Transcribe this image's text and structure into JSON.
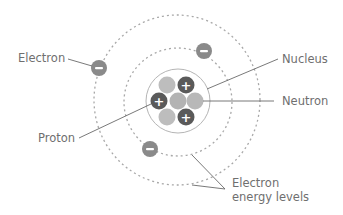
{
  "diagram": {
    "labels": {
      "electron": "Electron",
      "nucleus": "Nucleus",
      "neutron": "Neutron",
      "proton": "Proton",
      "energy_levels_line1": "Electron",
      "energy_levels_line2": "energy levels"
    },
    "symbols": {
      "proton": "+",
      "electron": "−"
    },
    "colors": {
      "proton": "#5a5a5a",
      "neutron": "#b8b8b8",
      "electron": "#8a8a8a",
      "orbit": "#a8a8a8",
      "leader_line": "#6a6a6a",
      "text": "#6f6f6f"
    },
    "counts": {
      "protons": 3,
      "neutrons": 4,
      "electrons": 3,
      "energy_levels": 2
    }
  }
}
